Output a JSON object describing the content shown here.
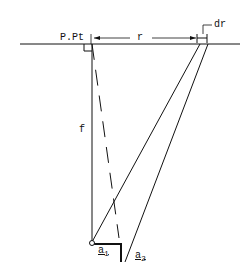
{
  "labels": {
    "principal_point": "P.Pt",
    "radial_distance": "r",
    "radial_increment": "dr",
    "focal_length": "f",
    "area_1": "a",
    "area_1_sub": "1",
    "area_2": "a",
    "area_2_sub": "2"
  },
  "colors": {
    "line": "#111111",
    "background": "#ffffff"
  }
}
